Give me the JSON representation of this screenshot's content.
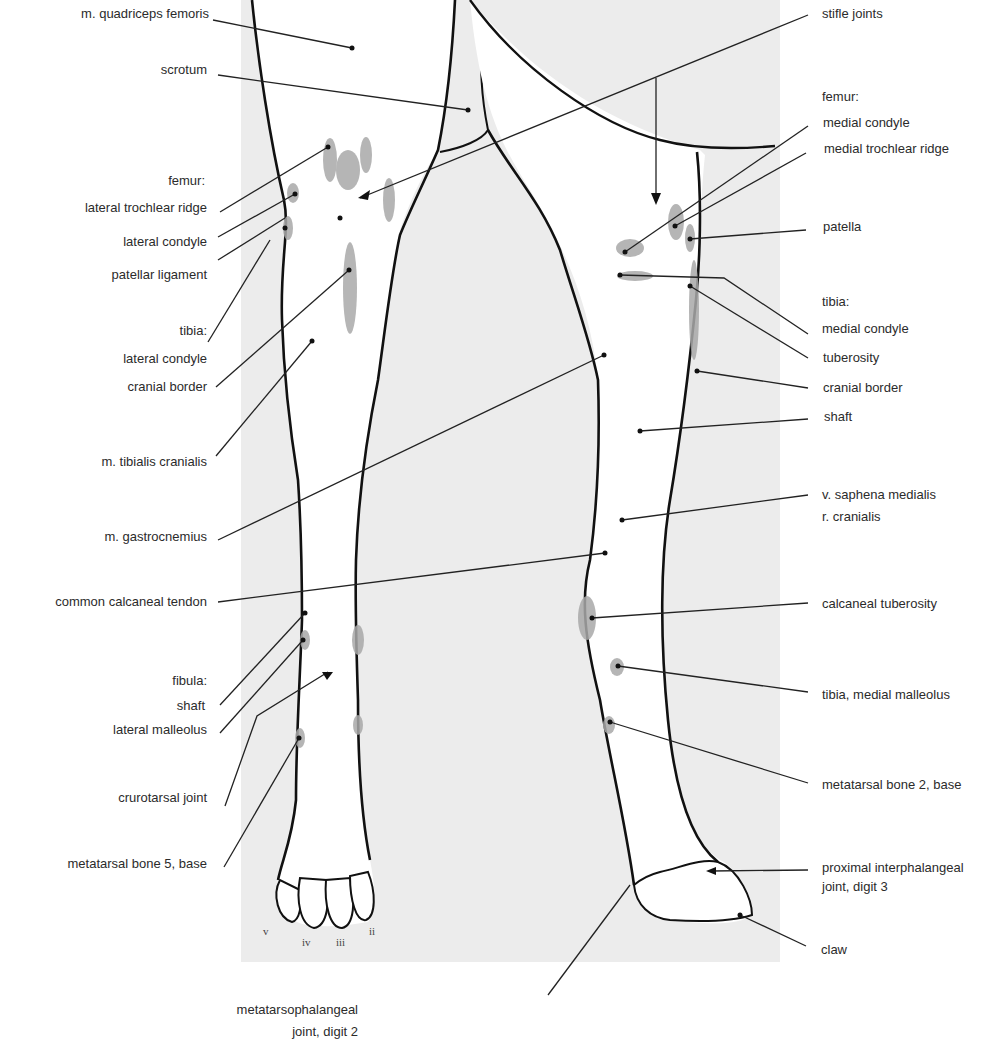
{
  "figure": {
    "colors": {
      "background_panel": "#ececec",
      "limb_fill": "#ffffff",
      "outline": "#111111",
      "highlight": "#a9a9a9",
      "leader": "#222222",
      "text": "#2b2b2b"
    }
  },
  "labels_left": [
    {
      "id": "m-quadriceps-femoris",
      "text": "m. quadriceps femoris"
    },
    {
      "id": "scrotum",
      "text": "scrotum"
    },
    {
      "id": "femur-heading",
      "text": "femur:"
    },
    {
      "id": "lateral-trochlear-ridge",
      "text": "lateral trochlear ridge"
    },
    {
      "id": "lateral-condyle-femur",
      "text": "lateral condyle"
    },
    {
      "id": "patellar-ligament",
      "text": "patellar ligament"
    },
    {
      "id": "tibia-heading",
      "text": "tibia:"
    },
    {
      "id": "lateral-condyle-tibia",
      "text": "lateral condyle"
    },
    {
      "id": "cranial-border-tibia-left",
      "text": "cranial border"
    },
    {
      "id": "m-tibialis-cranialis",
      "text": "m. tibialis cranialis"
    },
    {
      "id": "m-gastrocnemius",
      "text": "m. gastrocnemius"
    },
    {
      "id": "common-calcaneal-tendon",
      "text": "common calcaneal tendon"
    },
    {
      "id": "fibula-heading",
      "text": "fibula:"
    },
    {
      "id": "fibula-shaft",
      "text": "shaft"
    },
    {
      "id": "lateral-malleolus",
      "text": "lateral malleolus"
    },
    {
      "id": "crurotarsal-joint",
      "text": "crurotarsal joint"
    },
    {
      "id": "metatarsal-bone-5-base",
      "text": "metatarsal bone 5, base"
    }
  ],
  "labels_right": [
    {
      "id": "stifle-joints",
      "text": "stifle joints"
    },
    {
      "id": "femur-heading-right",
      "text": "femur:"
    },
    {
      "id": "medial-condyle-femur",
      "text": "medial condyle"
    },
    {
      "id": "medial-trochlear-ridge",
      "text": "medial trochlear ridge"
    },
    {
      "id": "patella",
      "text": "patella"
    },
    {
      "id": "tibia-heading-right",
      "text": "tibia:"
    },
    {
      "id": "medial-condyle-tibia",
      "text": "medial condyle"
    },
    {
      "id": "tuberosity",
      "text": "tuberosity"
    },
    {
      "id": "cranial-border-tibia-right",
      "text": "cranial border"
    },
    {
      "id": "tibia-shaft",
      "text": "shaft"
    },
    {
      "id": "v-saphena-medialis",
      "text": "v. saphena medialis"
    },
    {
      "id": "r-cranialis",
      "text": "r. cranialis"
    },
    {
      "id": "calcaneal-tuberosity",
      "text": "calcaneal tuberosity"
    },
    {
      "id": "tibia-medial-malleolus",
      "text": "tibia, medial malleolus"
    },
    {
      "id": "metatarsal-bone-2-base",
      "text": "metatarsal bone 2, base"
    },
    {
      "id": "proximal-interphalangeal-joint",
      "text": "proximal interphalangeal"
    },
    {
      "id": "proximal-interphalangeal-joint-2",
      "text": "joint, digit 3"
    },
    {
      "id": "claw",
      "text": "claw"
    }
  ],
  "labels_bottom": [
    {
      "id": "metatarsophalangeal-joint",
      "text": "metatarsophalangeal"
    },
    {
      "id": "metatarsophalangeal-joint-2",
      "text": "joint, digit 2"
    }
  ],
  "digit_numerals": [
    "v",
    "iv",
    "iii",
    "ii"
  ]
}
